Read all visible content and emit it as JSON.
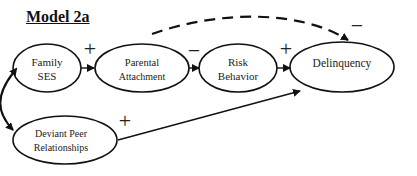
{
  "title": "Model 2a",
  "nodes": [
    {
      "id": "family_ses",
      "lines": [
        "Family",
        "SES"
      ]
    },
    {
      "id": "parental_attachment",
      "lines": [
        "Parental",
        "Attachment"
      ]
    },
    {
      "id": "risk_behavior",
      "lines": [
        "Risk",
        "Behavior"
      ]
    },
    {
      "id": "delinquency",
      "lines": [
        "Delinquency"
      ]
    },
    {
      "id": "deviant_peer",
      "lines": [
        "Deviant Peer",
        "Relationships"
      ]
    }
  ],
  "edges": [
    {
      "from": "family_ses",
      "to": "parental_attachment",
      "sign": "+",
      "style": "solid"
    },
    {
      "from": "parental_attachment",
      "to": "risk_behavior",
      "sign": "−",
      "style": "solid"
    },
    {
      "from": "risk_behavior",
      "to": "delinquency",
      "sign": "+",
      "style": "solid"
    },
    {
      "from": "parental_attachment",
      "to": "delinquency",
      "sign": "−",
      "style": "dashed"
    },
    {
      "from": "deviant_peer",
      "to": "delinquency",
      "sign": "+",
      "style": "solid"
    },
    {
      "from": "family_ses",
      "to": "deviant_peer",
      "sign": "",
      "style": "double-headed curved"
    }
  ]
}
